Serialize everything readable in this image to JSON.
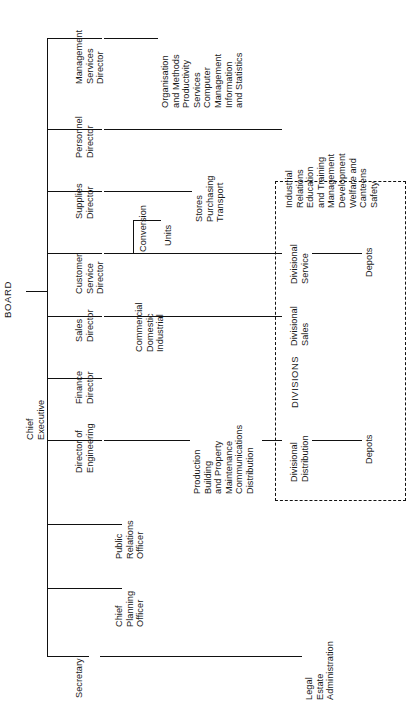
{
  "root": {
    "label": "BOARD"
  },
  "spine": {
    "label": "Chief\nExecutive"
  },
  "divisions_box": {
    "label": "DIVISIONS"
  },
  "branches": [
    {
      "id": "management-services-director",
      "label": "Management\nServices\nDirector",
      "children": [
        {
          "label": "Organisation\nand Methods\nProductivity\nServices\nComputer\nManagement\nInformation\nand Statistics"
        }
      ]
    },
    {
      "id": "personnel-director",
      "label": "Personnel\nDirector",
      "children": [
        {
          "label": "Industrial\nRelations\nEducation\nand Training\nManagement\nDevelopment\nWelfare and\nCanteens\nSafety"
        }
      ]
    },
    {
      "id": "supplies-director",
      "label": "Supplies\nDirector",
      "children": [
        {
          "label": "Stores\nPurchasing\nTransport"
        }
      ]
    },
    {
      "id": "customer-service-director",
      "label": "Customer\nService\nDirector",
      "children": [
        {
          "label": "Conversion"
        },
        {
          "label": "Units"
        },
        {
          "label": "Divisional\nService"
        },
        {
          "label": "Depots"
        }
      ]
    },
    {
      "id": "sales-director",
      "label": "Sales\nDirector",
      "children": [
        {
          "label": "Commercial\nDomestic\nIndustrial"
        },
        {
          "label": "Divisional\nSales"
        }
      ]
    },
    {
      "id": "finance-director",
      "label": "Finance\nDirector",
      "children": []
    },
    {
      "id": "director-of-engineering",
      "label": "Director of\nEngineering",
      "children": [
        {
          "label": "Production\nBuilding\nand Property\nMaintenance\nCommunications\nDistribution"
        },
        {
          "label": "Divisional\nDistribution"
        },
        {
          "label": "Depots"
        }
      ]
    },
    {
      "id": "public-relations-officer",
      "label": "Public\nRelations\nOfficer",
      "children": []
    },
    {
      "id": "chief-planning-officer",
      "label": "Chief\nPlanning\nOfficer",
      "children": []
    },
    {
      "id": "secretary",
      "label": "Secretary",
      "children": [
        {
          "label": "Legal\nEstate\nAdministration"
        }
      ]
    }
  ]
}
